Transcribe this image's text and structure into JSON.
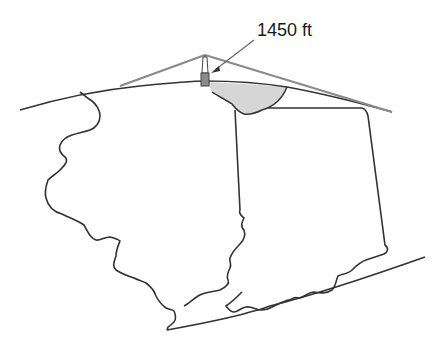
{
  "diagram": {
    "type": "line-of-sight illustration over a map outline",
    "annotation": {
      "label": "1450 ft",
      "points_to": "tower"
    },
    "elements": {
      "tower": "tall transmission tower at horizon",
      "sight_lines": "two gray lines from tower top tangent to earth curvature",
      "horizon": "curved earth surface line",
      "coverage_area": "light gray shaded region visible from tower",
      "map_regions": [
        "western state outline",
        "eastern state outline",
        "southern boundary line"
      ]
    },
    "colors": {
      "outline": "#333333",
      "sight_line": "#888888",
      "coverage_fill": "#d6d6d6",
      "tower_fill": "#8a8a8a"
    }
  }
}
